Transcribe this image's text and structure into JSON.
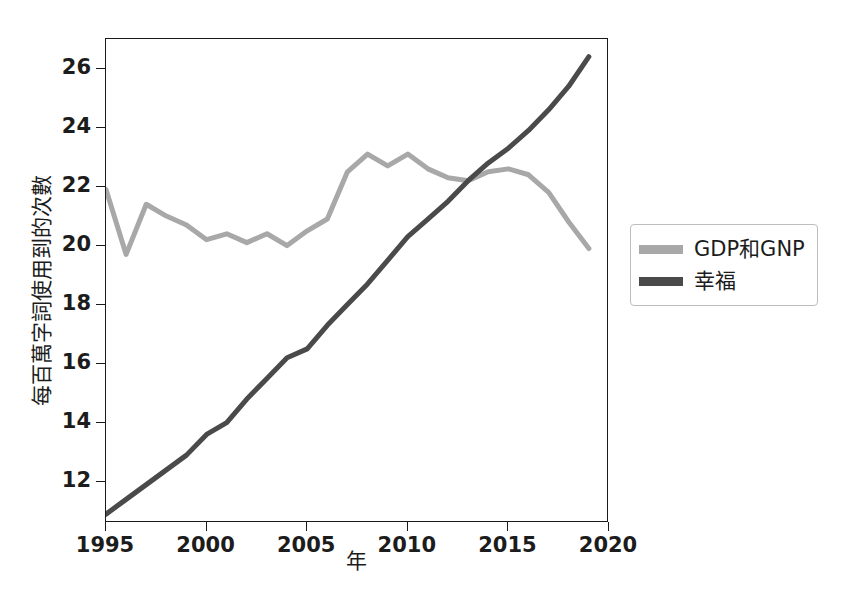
{
  "chart_data": {
    "type": "line",
    "title": "",
    "subtitle": "",
    "xlabel": "年",
    "ylabel": "每百萬字詞使用到的次數",
    "xlim": [
      1995,
      2020
    ],
    "ylim": [
      10.6,
      27.0
    ],
    "grid": false,
    "legend_position": "right",
    "xticks": [
      "1995",
      "2000",
      "2005",
      "2010",
      "2015",
      "2020"
    ],
    "xtick_values": [
      1995,
      2000,
      2005,
      2010,
      2015,
      2020
    ],
    "yticks": [
      "12",
      "14",
      "16",
      "18",
      "20",
      "22",
      "24",
      "26"
    ],
    "ytick_values": [
      12,
      14,
      16,
      18,
      20,
      22,
      24,
      26
    ],
    "x": [
      1995,
      1996,
      1997,
      1998,
      1999,
      2000,
      2001,
      2002,
      2003,
      2004,
      2005,
      2006,
      2007,
      2008,
      2009,
      2010,
      2011,
      2012,
      2013,
      2014,
      2015,
      2016,
      2017,
      2018,
      2019
    ],
    "series": [
      {
        "name": "GDP和GNP",
        "color": "#a8a8a8",
        "linewidth": 5,
        "values": [
          21.9,
          19.7,
          21.4,
          21.0,
          20.7,
          20.2,
          20.4,
          20.1,
          20.4,
          20.0,
          20.5,
          20.9,
          22.5,
          23.1,
          22.7,
          23.1,
          22.6,
          22.3,
          22.2,
          22.5,
          22.6,
          22.4,
          21.8,
          20.8,
          19.9
        ]
      },
      {
        "name": "幸福",
        "color": "#4a4a4a",
        "linewidth": 5,
        "values": [
          10.9,
          11.4,
          11.9,
          12.4,
          12.9,
          13.6,
          14.0,
          14.8,
          15.5,
          16.2,
          16.5,
          17.3,
          18.0,
          18.7,
          19.5,
          20.3,
          20.9,
          21.5,
          22.2,
          22.8,
          23.3,
          23.9,
          24.6,
          25.4,
          26.4
        ]
      }
    ]
  },
  "axis": {
    "xlabel": "年",
    "ylabel": "每百萬字詞使用到的次數"
  },
  "legend": {
    "items": [
      {
        "label": "GDP和GNP",
        "color": "#a8a8a8"
      },
      {
        "label": "幸福",
        "color": "#4a4a4a"
      }
    ]
  },
  "colors": {
    "axis": "#1a1a1a",
    "text": "#1c1c1c",
    "background": "#ffffff",
    "series_light": "#a8a8a8",
    "series_dark": "#4a4a4a"
  }
}
